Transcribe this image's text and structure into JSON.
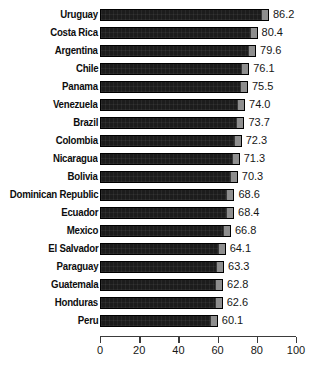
{
  "chart_data": {
    "type": "bar",
    "orientation": "horizontal",
    "title": "",
    "subtitle": "",
    "xlabel": "",
    "ylabel": "",
    "xlim": [
      0,
      100
    ],
    "xticks": [
      0,
      20,
      40,
      60,
      80,
      100
    ],
    "xtick_labels": [
      "0",
      "20",
      "40",
      "60",
      "80",
      "100"
    ],
    "grid": false,
    "legend": null,
    "sorted": "descending",
    "bar_color": "#1c1c1c",
    "bar_tip_color": "#8e8e8e",
    "axis_color": "#3b3b3b",
    "value_label_format": "one-decimal",
    "categories": [
      "Uruguay",
      "Costa Rica",
      "Argentina",
      "Chile",
      "Panama",
      "Venezuela",
      "Brazil",
      "Colombia",
      "Nicaragua",
      "Bolivia",
      "Dominican Republic",
      "Ecuador",
      "Mexico",
      "El Salvador",
      "Paraguay",
      "Guatemala",
      "Honduras",
      "Peru"
    ],
    "values": [
      86.2,
      80.4,
      79.6,
      76.1,
      75.5,
      74.0,
      73.7,
      72.3,
      71.3,
      70.3,
      68.6,
      68.4,
      66.8,
      64.1,
      63.3,
      62.8,
      62.6,
      60.1
    ],
    "value_labels": [
      "86.2",
      "80.4",
      "79.6",
      "76.1",
      "75.5",
      "74.0",
      "73.7",
      "72.3",
      "71.3",
      "70.3",
      "68.6",
      "68.4",
      "66.8",
      "64.1",
      "63.3",
      "62.8",
      "62.6",
      "60.1"
    ]
  }
}
